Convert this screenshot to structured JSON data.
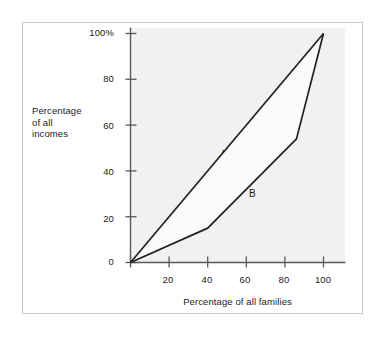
{
  "figure": {
    "background_color": "#ffffff",
    "frame_color": "#c9c9c9",
    "panel_color": "#f1f1f1",
    "line_color": "#231f20",
    "axis_color": "#58595b"
  },
  "chart_data": {
    "type": "line",
    "title": "",
    "subtitle": "",
    "xlabel": "Percentage of all families",
    "ylabel": "Percentage of all incomes",
    "ylabel_lines": [
      "Percentage",
      "of all",
      "incomes"
    ],
    "xlim": [
      0,
      100
    ],
    "ylim": [
      0,
      100
    ],
    "grid": false,
    "legend_position": "inline-annotation",
    "xticks": [
      0,
      20,
      40,
      60,
      80,
      100
    ],
    "xtick_labels": [
      "",
      "20",
      "40",
      "60",
      "80",
      "100"
    ],
    "yticks": [
      0,
      20,
      40,
      60,
      80,
      100
    ],
    "ytick_labels": [
      "0",
      "20",
      "40",
      "60",
      "80",
      "100%"
    ],
    "shaded_between_series": true,
    "series": [
      {
        "name": "A",
        "label": "A",
        "description": "line of perfect equality",
        "x": [
          0,
          100
        ],
        "y": [
          0,
          100
        ],
        "annotation": {
          "text": "A",
          "x": 48,
          "y": 47
        }
      },
      {
        "name": "B",
        "label": "B",
        "description": "Lorenz curve of actual income distribution",
        "x": [
          0,
          40,
          86,
          100
        ],
        "y": [
          0,
          15,
          54,
          100
        ],
        "annotation": {
          "text": "B",
          "x": 63,
          "y": 30
        }
      }
    ]
  }
}
